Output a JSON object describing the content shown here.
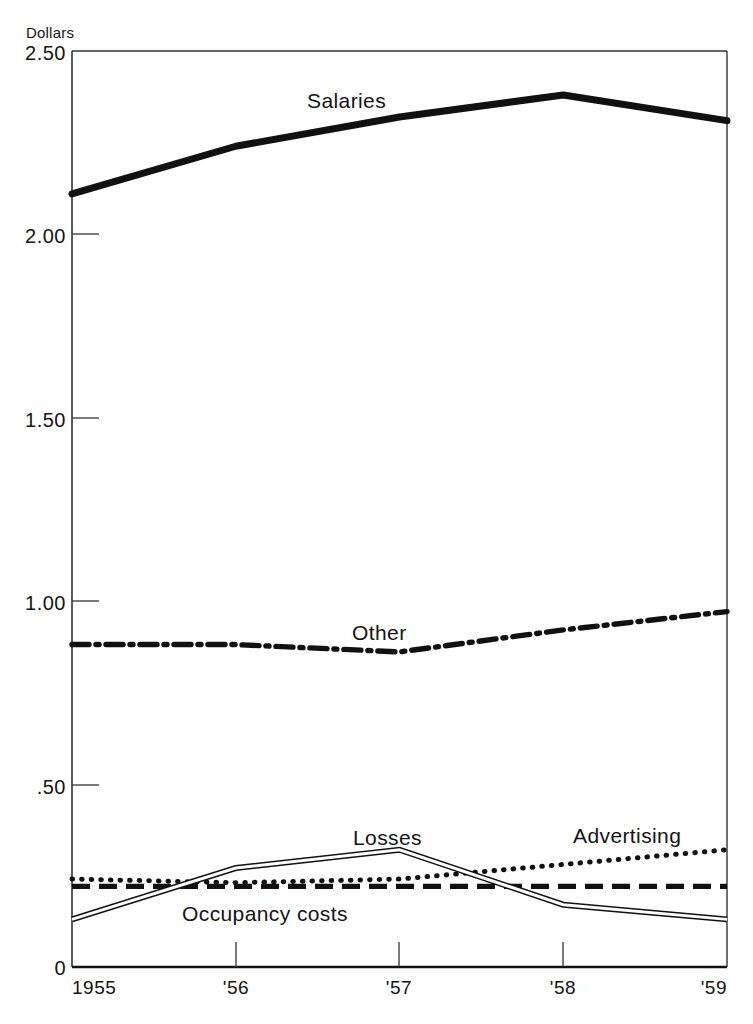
{
  "chart_data": {
    "type": "line",
    "title": "",
    "xlabel": "",
    "ylabel": "Dollars",
    "unit_label": "Dollars",
    "x": [
      1955,
      1956,
      1957,
      1958,
      1959
    ],
    "categories": [
      "1955",
      "'56",
      "'57",
      "'58",
      "'59"
    ],
    "xtick_labels": [
      "1955",
      "'56",
      "'57",
      "'58",
      "'59"
    ],
    "ytick_labels": [
      "2.50",
      "2.00",
      "1.50",
      "1.00",
      ".50",
      "0"
    ],
    "ytick_values": [
      2.5,
      2.0,
      1.5,
      1.0,
      0.5,
      0.0
    ],
    "ylim": [
      0,
      2.5
    ],
    "xlim": [
      1955,
      1959
    ],
    "grid": false,
    "legend": "inline-labels",
    "series": [
      {
        "name": "Salaries",
        "label": "Salaries",
        "style": "thick-solid",
        "color": "#111111",
        "values": [
          2.11,
          2.24,
          2.32,
          2.38,
          2.31
        ],
        "label_x": 1956.55,
        "label_y": 2.42
      },
      {
        "name": "Other",
        "label": "Other",
        "style": "dash-dot",
        "color": "#111111",
        "values": [
          0.88,
          0.88,
          0.86,
          0.92,
          0.97
        ],
        "label_x": 1956.85,
        "label_y": 0.96
      },
      {
        "name": "Losses",
        "label": "Losses",
        "style": "double-hollow",
        "color": "#111111",
        "values": [
          0.13,
          0.27,
          0.32,
          0.17,
          0.13
        ],
        "label_x": 1956.9,
        "label_y": 0.38
      },
      {
        "name": "Advertising",
        "label": "Advertising",
        "style": "dotted",
        "color": "#111111",
        "values": [
          0.24,
          0.23,
          0.24,
          0.28,
          0.32
        ],
        "label_x": 1958.2,
        "label_y": 0.38
      },
      {
        "name": "Occupancy costs",
        "label": "Occupancy costs",
        "style": "dashed",
        "color": "#111111",
        "values": [
          0.22,
          0.22,
          0.22,
          0.22,
          0.22
        ],
        "label_x": 1956.0,
        "label_y": 0.15
      }
    ]
  },
  "axes": {
    "unit_label": "Dollars",
    "y_ticks": [
      {
        "label": "2.50",
        "value": 2.5
      },
      {
        "label": "2.00",
        "value": 2.0
      },
      {
        "label": "1.50",
        "value": 1.5
      },
      {
        "label": "1.00",
        "value": 1.0
      },
      {
        "label": ".50",
        "value": 0.5
      },
      {
        "label": "0",
        "value": 0.0
      }
    ],
    "x_ticks": [
      {
        "label": "1955",
        "value": 1955
      },
      {
        "label": "'56",
        "value": 1956
      },
      {
        "label": "'57",
        "value": 1957
      },
      {
        "label": "'58",
        "value": 1958
      },
      {
        "label": "'59",
        "value": 1959
      }
    ]
  },
  "labels": {
    "salaries": "Salaries",
    "other": "Other",
    "losses": "Losses",
    "advertising": "Advertising",
    "occupancy": "Occupancy costs"
  }
}
